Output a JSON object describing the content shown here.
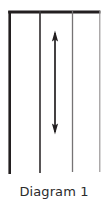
{
  "figure": {
    "caption": "Diagram 1",
    "type": "line-diagram",
    "background_color": "#ffffff",
    "ink_color": "#231f20"
  },
  "diagram_data": {
    "type": "technical-line-drawing",
    "description": "Four vertical parallel lines descending from a horizontal top bar, with a vertical double-headed arrow between the second and third lines",
    "top_bar": {
      "name": "top-horizontal-bar",
      "x1": 9.5,
      "x2": 100,
      "y": 12,
      "stroke_width": 3,
      "color": "#231f20"
    },
    "vertical_lines": [
      {
        "name": "vertical-line-1",
        "x": 9.5,
        "y_top": 12,
        "y_bottom": 174,
        "stroke_width": 2.6,
        "color": "#231f20"
      },
      {
        "name": "vertical-line-2",
        "x": 40.0,
        "y_top": 12,
        "y_bottom": 174,
        "stroke_width": 1.6,
        "color": "#3b3839"
      },
      {
        "name": "vertical-line-3",
        "x": 72.5,
        "y_top": 12,
        "y_bottom": 174,
        "stroke_width": 1.3,
        "color": "#6f6c6d"
      },
      {
        "name": "vertical-line-4",
        "x": 99.8,
        "y_top": 12,
        "y_bottom": 174,
        "stroke_width": 1.1,
        "color": "#8b8889"
      }
    ],
    "arrow": {
      "name": "double-headed-vertical-arrow",
      "x": 55,
      "y_top": 31,
      "y_bottom": 134,
      "shaft_width": 1.6,
      "head_length": 9,
      "head_half_width": 3.2,
      "double_headed": true,
      "color": "#231f20"
    }
  }
}
